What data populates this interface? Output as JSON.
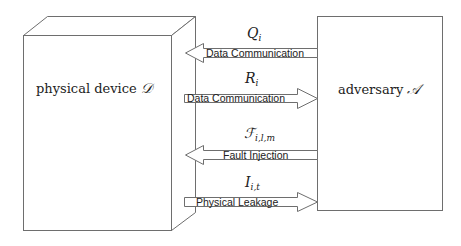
{
  "diagram": {
    "device": {
      "label": "physical device",
      "symbol": "𝒟"
    },
    "adversary": {
      "label": "adversary",
      "symbol": "𝒜"
    },
    "arrows": [
      {
        "symbol": "Q",
        "subscript": "i",
        "label": "Data Communication",
        "direction": "to-device"
      },
      {
        "symbol": "R",
        "subscript": "i",
        "label": "Data Communication",
        "direction": "to-adversary"
      },
      {
        "symbol": "ℱ",
        "subscript": "i,l,m",
        "label": "Fault Injection",
        "direction": "to-device"
      },
      {
        "symbol": "I",
        "subscript": "i,t",
        "label": "Physical Leakage",
        "direction": "to-adversary"
      }
    ],
    "colors": {
      "stroke": "#6e6e6e",
      "fill": "#ffffff",
      "text": "#222222"
    }
  }
}
